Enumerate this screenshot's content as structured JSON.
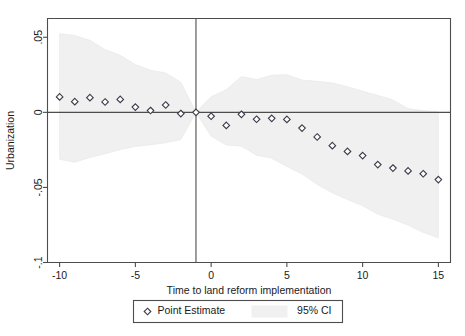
{
  "chart_data": {
    "type": "scatter",
    "title": "",
    "subtitle": "",
    "xlabel": "Time to land reform implementation",
    "ylabel": "Urbanization",
    "xlim": [
      -10.8,
      15.8
    ],
    "ylim": [
      -0.1,
      0.0625
    ],
    "xticks": [
      -10,
      -5,
      0,
      5,
      10,
      15
    ],
    "xticklabels": [
      "-10",
      "-5",
      "0",
      "5",
      "10",
      "15"
    ],
    "yticks": [
      0.05,
      0,
      -0.05,
      -0.1
    ],
    "yticklabels": [
      ".05",
      "0",
      "-.05",
      "-.1"
    ],
    "grid": false,
    "reference_lines": {
      "horizontal_y": 0,
      "vertical_x": -1
    },
    "legend": {
      "position": "below-plot",
      "entries": [
        {
          "label": "Point Estimate",
          "marker": "diamond-open"
        },
        {
          "label": "95% CI",
          "marker": "shaded-band"
        }
      ]
    },
    "x": [
      -10,
      -9,
      -8,
      -7,
      -6,
      -5,
      -4,
      -3,
      -2,
      -1,
      0,
      1,
      2,
      3,
      4,
      5,
      6,
      7,
      8,
      9,
      10,
      11,
      12,
      13,
      14,
      15
    ],
    "series": [
      {
        "name": "Point Estimate",
        "values": [
          0.0103,
          0.0071,
          0.0098,
          0.0069,
          0.0086,
          0.0035,
          0.0012,
          0.0049,
          -0.0008,
          0.0,
          -0.0026,
          -0.0087,
          -0.0013,
          -0.0046,
          -0.004,
          -0.0047,
          -0.0105,
          -0.0164,
          -0.0222,
          -0.026,
          -0.0288,
          -0.0348,
          -0.0371,
          -0.039,
          -0.0409,
          -0.0448
        ]
      },
      {
        "name": "95% CI upper",
        "values": [
          0.0524,
          0.0512,
          0.048,
          0.0419,
          0.038,
          0.0318,
          0.0281,
          0.0262,
          0.0201,
          0.0,
          0.0104,
          0.0151,
          0.0238,
          0.0219,
          0.0247,
          0.0251,
          0.0215,
          0.0207,
          0.0196,
          0.0171,
          0.0141,
          0.0113,
          0.0083,
          0.0025,
          0.0012,
          0.0004
        ]
      },
      {
        "name": "95% CI lower",
        "values": [
          -0.0313,
          -0.0332,
          -0.03,
          -0.0276,
          -0.0248,
          -0.0227,
          -0.0216,
          -0.0203,
          -0.0181,
          0.0,
          -0.0159,
          -0.0217,
          -0.0226,
          -0.0285,
          -0.0306,
          -0.036,
          -0.0411,
          -0.048,
          -0.0536,
          -0.0581,
          -0.0622,
          -0.0678,
          -0.0712,
          -0.0751,
          -0.08,
          -0.0836
        ]
      }
    ]
  },
  "axes": {
    "y_title": "Urbanization",
    "x_title": "Time to land reform implementation"
  },
  "legend": {
    "point_estimate_label": "Point Estimate",
    "ci_label": "95% CI"
  },
  "colors": {
    "band": "#f0f0f0",
    "marker_stroke": "#3a3a46",
    "axis": "#4d4d4d",
    "text": "#1a1a1a",
    "background": "#ffffff"
  }
}
